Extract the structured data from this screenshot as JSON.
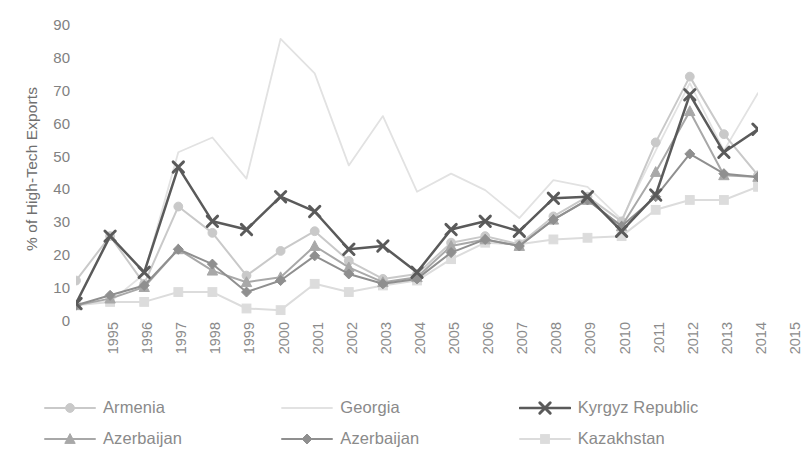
{
  "chart_data": {
    "type": "line",
    "title": "",
    "xlabel": "",
    "ylabel": "% of High-Tech Exports",
    "ylim": [
      0,
      90
    ],
    "yticks": [
      90,
      80,
      70,
      60,
      50,
      40,
      30,
      20,
      10,
      0
    ],
    "grid": false,
    "legend_position": "bottom",
    "categories": [
      "1995",
      "1996",
      "1997",
      "1998",
      "1999",
      "1900-placeholder-unused",
      "2001",
      "2002",
      "2003",
      "2004",
      "2005",
      "2006",
      "2007",
      "2008",
      "2009",
      "2010",
      "2011",
      "2012",
      "2013",
      "2014",
      "2015"
    ],
    "x": [
      "1995",
      "1996",
      "1997",
      "1998",
      "1999",
      "2000",
      "2001",
      "2002",
      "2003",
      "2004",
      "2005",
      "2006",
      "2007",
      "2008",
      "2009",
      "2010",
      "2011",
      "2012",
      "2013",
      "2014",
      "2015"
    ],
    "series": [
      {
        "name": "Armenia",
        "marker": "circle",
        "color": "#c9c9c9",
        "values": [
          12.0,
          25.5,
          11.0,
          34.5,
          26.5,
          13.5,
          21.0,
          27.0,
          18.0,
          12.5,
          14.0,
          23.5,
          25.5,
          23.0,
          31.5,
          37.5,
          30.0,
          54.0,
          74.0,
          56.5,
          44.0
        ]
      },
      {
        "name": "Georgia",
        "marker": "none",
        "color": "#e2e2e2",
        "values": [
          5.0,
          5.5,
          14.0,
          51.0,
          55.5,
          43.0,
          85.5,
          75.0,
          47.0,
          62.0,
          39.0,
          44.5,
          39.5,
          31.0,
          42.5,
          40.5,
          30.5,
          51.5,
          72.0,
          51.5,
          69.0
        ]
      },
      {
        "name": "Kyrgyz Republic",
        "marker": "x",
        "color": "#5a5a5a",
        "values": [
          5.0,
          25.5,
          14.5,
          46.5,
          30.0,
          27.5,
          37.5,
          33.0,
          21.5,
          22.5,
          14.5,
          27.5,
          30.0,
          27.0,
          37.0,
          37.5,
          27.0,
          38.0,
          68.5,
          51.0,
          58.0
        ]
      },
      {
        "name": "Azerbaijan",
        "marker": "triangle",
        "color": "#a8a8a8",
        "values": [
          4.5,
          6.5,
          10.0,
          21.5,
          15.0,
          11.5,
          13.0,
          22.5,
          16.0,
          11.5,
          13.0,
          22.5,
          24.5,
          22.5,
          30.5,
          36.5,
          28.5,
          45.0,
          63.5,
          44.0,
          43.5
        ]
      },
      {
        "name": "Azerbaijan",
        "marker": "diamond",
        "color": "#8f8f8f",
        "values": [
          4.5,
          7.5,
          10.5,
          21.5,
          17.0,
          8.5,
          12.0,
          19.5,
          14.0,
          11.0,
          12.5,
          20.5,
          24.5,
          22.5,
          30.5,
          36.5,
          28.5,
          37.5,
          50.5,
          44.5,
          43.5
        ]
      },
      {
        "name": "Kazakhstan",
        "marker": "square",
        "color": "#dcdcdc",
        "values": [
          4.5,
          5.5,
          5.5,
          8.5,
          8.5,
          3.5,
          3.0,
          11.0,
          8.5,
          10.5,
          12.0,
          18.5,
          23.5,
          23.0,
          24.5,
          25.0,
          25.5,
          33.5,
          36.5,
          36.5,
          40.5
        ]
      }
    ]
  },
  "legend": {
    "items": [
      {
        "label": "Armenia",
        "marker": "circle",
        "color": "#c9c9c9"
      },
      {
        "label": "Georgia",
        "marker": "none",
        "color": "#e2e2e2"
      },
      {
        "label": "Kyrgyz Republic",
        "marker": "x",
        "color": "#5a5a5a"
      },
      {
        "label": "Azerbaijan",
        "marker": "triangle",
        "color": "#a8a8a8"
      },
      {
        "label": "Azerbaijan",
        "marker": "diamond",
        "color": "#8f8f8f"
      },
      {
        "label": "Kazakhstan",
        "marker": "square",
        "color": "#dcdcdc"
      }
    ]
  }
}
